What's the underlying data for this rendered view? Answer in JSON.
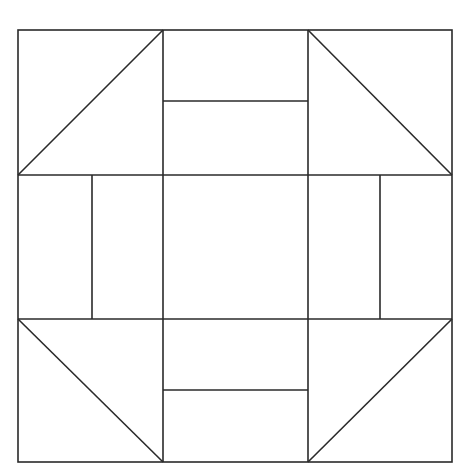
{
  "diagram": {
    "type": "quilt-block",
    "colors": {
      "background": "#ffffff",
      "stroke": "#2a2a2a"
    },
    "outer": {
      "x": 18,
      "y": 30,
      "width": 434,
      "height": 432
    }
  }
}
